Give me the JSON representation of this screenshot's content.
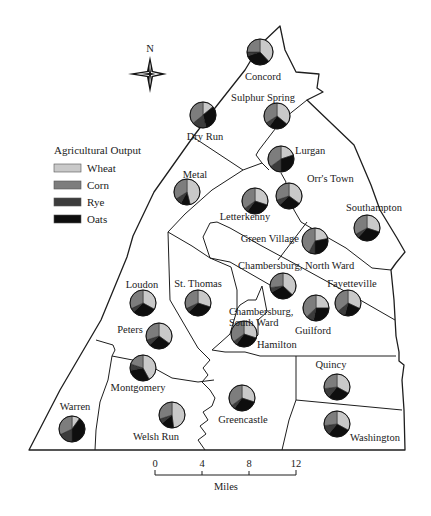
{
  "compass": {
    "label": "N",
    "x": 149,
    "y": 72
  },
  "legend": {
    "title": "Agricultural Output",
    "x": 54,
    "y": 150,
    "items": [
      {
        "key": "wheat",
        "label": "Wheat",
        "color": "#c9c9c9"
      },
      {
        "key": "corn",
        "label": "Corn",
        "color": "#7d7d7d"
      },
      {
        "key": "rye",
        "label": "Rye",
        "color": "#3c3c3c"
      },
      {
        "key": "oats",
        "label": "Oats",
        "color": "#0e0e0e"
      }
    ]
  },
  "scale_bar": {
    "unit_label": "Miles",
    "ticks": [
      "0",
      "4",
      "8",
      "12"
    ],
    "x0": 155,
    "x1": 296,
    "y": 475
  },
  "townships": [
    {
      "name": "Concord",
      "pie": [
        260,
        52
      ],
      "label": [
        263,
        80
      ],
      "anchor": "middle",
      "shares": {
        "wheat": 0.38,
        "corn": 0.25,
        "rye": 0.05,
        "oats": 0.32
      }
    },
    {
      "name": "Sulphur Spring",
      "pie": [
        277,
        116
      ],
      "label": [
        263,
        101
      ],
      "anchor": "middle",
      "shares": {
        "wheat": 0.36,
        "corn": 0.34,
        "rye": 0.06,
        "oats": 0.24
      }
    },
    {
      "name": "Dry Run",
      "pie": [
        203,
        115
      ],
      "label": [
        205,
        140
      ],
      "anchor": "middle",
      "shares": {
        "wheat": 0.14,
        "corn": 0.36,
        "rye": 0.18,
        "oats": 0.32
      }
    },
    {
      "name": "Lurgan",
      "pie": [
        281,
        159
      ],
      "label": [
        295,
        154
      ],
      "anchor": "start",
      "shares": {
        "wheat": 0.2,
        "corn": 0.35,
        "rye": 0.15,
        "oats": 0.3
      }
    },
    {
      "name": "Metal",
      "pie": [
        187,
        192
      ],
      "label": [
        195,
        178
      ],
      "anchor": "middle",
      "shares": {
        "wheat": 0.46,
        "corn": 0.34,
        "rye": 0.08,
        "oats": 0.12
      }
    },
    {
      "name": "Letterkenny",
      "pie": [
        255,
        201
      ],
      "label": [
        245,
        220
      ],
      "anchor": "middle",
      "shares": {
        "wheat": 0.3,
        "corn": 0.35,
        "rye": 0.05,
        "oats": 0.3
      }
    },
    {
      "name": "Orr's Town",
      "pie": [
        289,
        196
      ],
      "label": [
        307,
        182
      ],
      "anchor": "start",
      "shares": {
        "wheat": 0.35,
        "corn": 0.3,
        "rye": 0.07,
        "oats": 0.28
      }
    },
    {
      "name": "Southampton",
      "pie": [
        367,
        228
      ],
      "label": [
        374,
        211
      ],
      "anchor": "middle",
      "shares": {
        "wheat": 0.3,
        "corn": 0.33,
        "rye": 0.05,
        "oats": 0.32
      }
    },
    {
      "name": "Green Village",
      "pie": [
        315,
        241
      ],
      "label": [
        299,
        242
      ],
      "anchor": "end",
      "shares": {
        "wheat": 0.22,
        "corn": 0.42,
        "rye": 0.08,
        "oats": 0.28
      }
    },
    {
      "name": "Chambersburg, North Ward",
      "pie": [
        283,
        286
      ],
      "label": [
        238,
        269
      ],
      "anchor": "start",
      "shares": {
        "wheat": 0.37,
        "corn": 0.27,
        "rye": 0.06,
        "oats": 0.3
      }
    },
    {
      "name": "St. Thomas",
      "pie": [
        198,
        303
      ],
      "label": [
        198,
        287
      ],
      "anchor": "middle",
      "shares": {
        "wheat": 0.3,
        "corn": 0.32,
        "rye": 0.05,
        "oats": 0.33
      }
    },
    {
      "name": "Loudon",
      "pie": [
        143,
        303
      ],
      "label": [
        142,
        288
      ],
      "anchor": "middle",
      "shares": {
        "wheat": 0.33,
        "corn": 0.32,
        "rye": 0.05,
        "oats": 0.3
      }
    },
    {
      "name": "Guilford",
      "pie": [
        316,
        308
      ],
      "label": [
        313,
        334
      ],
      "anchor": "middle",
      "shares": {
        "wheat": 0.25,
        "corn": 0.37,
        "rye": 0.1,
        "oats": 0.28
      }
    },
    {
      "name": "Fayetteville",
      "pie": [
        348,
        303
      ],
      "label": [
        352,
        287
      ],
      "anchor": "middle",
      "shares": {
        "wheat": 0.32,
        "corn": 0.36,
        "rye": 0.1,
        "oats": 0.22
      }
    },
    {
      "name": "Chambersburg,",
      "pie": null,
      "label": [
        229,
        315
      ],
      "anchor": "start",
      "shares": null
    },
    {
      "name": "South Ward",
      "pie": null,
      "label": [
        229,
        326
      ],
      "anchor": "start",
      "shares": null
    },
    {
      "name": "Chambersburg, South Ward (Hamilton pie)",
      "display": false,
      "pie": [
        244,
        334
      ],
      "label": null,
      "anchor": "start",
      "shares": {
        "wheat": 0.3,
        "corn": 0.35,
        "rye": 0.05,
        "oats": 0.3
      }
    },
    {
      "name": "Hamilton",
      "pie": null,
      "label": [
        257,
        348
      ],
      "anchor": "start",
      "shares": null
    },
    {
      "name": "Peters",
      "pie": [
        159,
        336
      ],
      "label": [
        130,
        333
      ],
      "anchor": "middle",
      "shares": {
        "wheat": 0.35,
        "corn": 0.3,
        "rye": 0.07,
        "oats": 0.28
      }
    },
    {
      "name": "Montgomery",
      "pie": [
        143,
        368
      ],
      "label": [
        138,
        391
      ],
      "anchor": "middle",
      "shares": {
        "wheat": 0.42,
        "corn": 0.2,
        "rye": 0.08,
        "oats": 0.3
      }
    },
    {
      "name": "Warren",
      "pie": [
        72,
        429
      ],
      "label": [
        75,
        410
      ],
      "anchor": "middle",
      "shares": {
        "wheat": 0.1,
        "corn": 0.32,
        "rye": 0.18,
        "oats": 0.4
      }
    },
    {
      "name": "Welsh Run",
      "pie": [
        172,
        415
      ],
      "label": [
        156,
        440
      ],
      "anchor": "middle",
      "shares": {
        "wheat": 0.48,
        "corn": 0.3,
        "rye": 0.06,
        "oats": 0.16
      }
    },
    {
      "name": "Greencastle",
      "pie": [
        242,
        398
      ],
      "label": [
        243,
        423
      ],
      "anchor": "middle",
      "shares": {
        "wheat": 0.3,
        "corn": 0.35,
        "rye": 0.05,
        "oats": 0.3
      }
    },
    {
      "name": "Quincy",
      "pie": [
        337,
        387
      ],
      "label": [
        331,
        368
      ],
      "anchor": "middle",
      "shares": {
        "wheat": 0.33,
        "corn": 0.27,
        "rye": 0.12,
        "oats": 0.28
      }
    },
    {
      "name": "Washington",
      "pie": [
        337,
        424
      ],
      "label": [
        350,
        441
      ],
      "anchor": "start",
      "shares": {
        "wheat": 0.33,
        "corn": 0.27,
        "rye": 0.12,
        "oats": 0.28
      }
    }
  ],
  "pie_radius": 13
}
